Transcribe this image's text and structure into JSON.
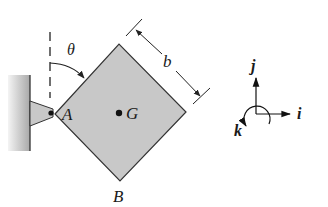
{
  "diagram": {
    "labels": {
      "angle": "θ",
      "side_length": "b",
      "pin": "A",
      "center_of_mass": "G",
      "bottom_corner": "B"
    },
    "axes": {
      "i": "i",
      "j": "j",
      "k": "k"
    },
    "colors": {
      "plate_fill": "#c8c8c8",
      "stroke": "#333333",
      "wall_dark": "#9a9a9a",
      "wall_light": "#ececec"
    }
  }
}
